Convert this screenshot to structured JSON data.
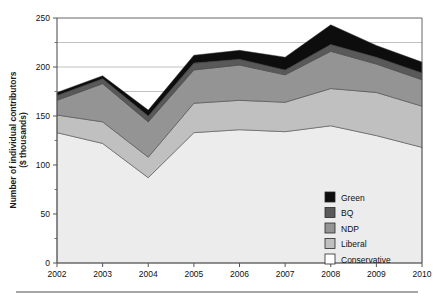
{
  "chart_data": {
    "type": "area",
    "stacked": true,
    "title": "",
    "xlabel": "",
    "ylabel": "Number of individual contributors ($ thousands)",
    "ylabel_line1": "Number of individual contributors",
    "ylabel_line2": "($ thousands)",
    "categories": [
      "2002",
      "2003",
      "2004",
      "2005",
      "2006",
      "2007",
      "2008",
      "2009",
      "2010"
    ],
    "x": [
      2002,
      2003,
      2004,
      2005,
      2006,
      2007,
      2008,
      2009,
      2010
    ],
    "series": [
      {
        "name": "Conservative",
        "color": "#ececec",
        "values": [
          133,
          122,
          87,
          133,
          136,
          134,
          140,
          130,
          118
        ]
      },
      {
        "name": "Liberal",
        "color": "#c0c0c0",
        "values": [
          18,
          22,
          21,
          30,
          30,
          30,
          38,
          44,
          42
        ]
      },
      {
        "name": "NDP",
        "color": "#949494",
        "values": [
          15,
          39,
          36,
          34,
          36,
          28,
          38,
          29,
          27
        ]
      },
      {
        "name": "BQ",
        "color": "#595959",
        "values": [
          5,
          5,
          6,
          7,
          6,
          5,
          7,
          7,
          7
        ]
      },
      {
        "name": "Green",
        "color": "#0d0d0d",
        "values": [
          3,
          3,
          6,
          8,
          9,
          13,
          20,
          12,
          11
        ]
      }
    ],
    "cumulative_tops": {
      "Conservative": [
        133,
        122,
        87,
        133,
        136,
        134,
        140,
        130,
        118
      ],
      "Liberal": [
        151,
        144,
        108,
        163,
        166,
        164,
        178,
        174,
        160
      ],
      "NDP": [
        166,
        183,
        144,
        197,
        202,
        192,
        216,
        203,
        187
      ],
      "BQ": [
        171,
        188,
        150,
        204,
        208,
        197,
        223,
        210,
        194
      ],
      "Green": [
        174,
        191,
        156,
        212,
        217,
        210,
        243,
        222,
        205
      ]
    },
    "ylim": [
      0,
      250
    ],
    "yticks": [
      0,
      50,
      100,
      150,
      200,
      250
    ],
    "ytick_labels": [
      "0",
      "50",
      "100",
      "150",
      "200",
      "250"
    ],
    "yminor_ticks": [
      25,
      75,
      125,
      175,
      225
    ],
    "gridlines": [
      225,
      200,
      175
    ],
    "grid": true,
    "legend_position": "inside-right",
    "legend": [
      {
        "label": "Green",
        "color": "#0d0d0d"
      },
      {
        "label": "BQ",
        "color": "#595959"
      },
      {
        "label": "NDP",
        "color": "#949494"
      },
      {
        "label": "Liberal",
        "color": "#c0c0c0"
      },
      {
        "label": "Conservative",
        "color": "#ffffff"
      }
    ]
  },
  "style": {
    "background": "#ffffff",
    "axis_color": "#555555",
    "grid_color": "#b0b0b0",
    "text_color": "#111111",
    "rule_color": "#888888"
  }
}
